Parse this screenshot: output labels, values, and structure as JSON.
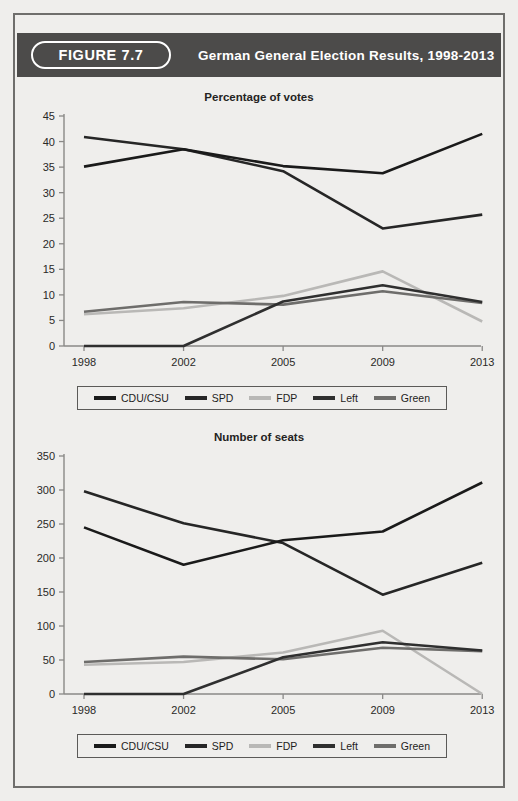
{
  "header": {
    "figure_badge": "FIGURE 7.7",
    "title": "German General Election Results, 1998-2013"
  },
  "colors": {
    "bar_background": "#4c4b4a",
    "page_background": "#efeeec",
    "frame": "#6f6e6c",
    "cdu_csu": "#1a1a1a",
    "spd": "#262626",
    "fdp": "#b9b8b6",
    "left": "#2f2f2f",
    "green": "#6e6d6b",
    "axis": "#8a8987",
    "text": "#242322"
  },
  "legend": {
    "entries": [
      {
        "label": "CDU/CSU",
        "color": "#1a1a1a"
      },
      {
        "label": "SPD",
        "color": "#262626"
      },
      {
        "label": "FDP",
        "color": "#b9b8b6"
      },
      {
        "label": "Left",
        "color": "#2f2f2f"
      },
      {
        "label": "Green",
        "color": "#6e6d6b"
      }
    ]
  },
  "chart_data": [
    {
      "id": "percentage-of-votes",
      "type": "line",
      "title": "Percentage of votes",
      "xlabel": "",
      "ylabel": "",
      "categories": [
        "1998",
        "2002",
        "2005",
        "2009",
        "2013"
      ],
      "x_ticks": [
        "1998",
        "2002",
        "2005",
        "2009",
        "2013"
      ],
      "y_ticks": [
        0,
        5,
        10,
        15,
        20,
        25,
        30,
        35,
        40,
        45
      ],
      "ylim": [
        0,
        45
      ],
      "grid": false,
      "legend_position": "bottom",
      "series": [
        {
          "name": "CDU/CSU",
          "color": "#1a1a1a",
          "values": [
            35.1,
            38.5,
            35.2,
            33.8,
            41.5
          ]
        },
        {
          "name": "SPD",
          "color": "#262626",
          "values": [
            40.9,
            38.5,
            34.2,
            23.0,
            25.7
          ]
        },
        {
          "name": "FDP",
          "color": "#b9b8b6",
          "values": [
            6.2,
            7.4,
            9.8,
            14.6,
            4.8
          ]
        },
        {
          "name": "Left",
          "color": "#2f2f2f",
          "values": [
            0.0,
            0.0,
            8.7,
            11.9,
            8.6
          ]
        },
        {
          "name": "Green",
          "color": "#6e6d6b",
          "values": [
            6.7,
            8.6,
            8.1,
            10.7,
            8.4
          ]
        }
      ]
    },
    {
      "id": "number-of-seats",
      "type": "line",
      "title": "Number of seats",
      "xlabel": "",
      "ylabel": "",
      "categories": [
        "1998",
        "2002",
        "2005",
        "2009",
        "2013"
      ],
      "x_ticks": [
        "1998",
        "2002",
        "2005",
        "2009",
        "2013"
      ],
      "y_ticks": [
        0,
        50,
        100,
        150,
        200,
        250,
        300,
        350
      ],
      "ylim": [
        0,
        350
      ],
      "grid": false,
      "legend_position": "bottom",
      "series": [
        {
          "name": "CDU/CSU",
          "color": "#1a1a1a",
          "values": [
            245,
            190,
            226,
            239,
            311
          ]
        },
        {
          "name": "SPD",
          "color": "#262626",
          "values": [
            298,
            251,
            222,
            146,
            193
          ]
        },
        {
          "name": "FDP",
          "color": "#b9b8b6",
          "values": [
            43,
            47,
            61,
            93,
            0
          ]
        },
        {
          "name": "Left",
          "color": "#2f2f2f",
          "values": [
            0,
            0,
            54,
            76,
            64
          ]
        },
        {
          "name": "Green",
          "color": "#6e6d6b",
          "values": [
            47,
            55,
            51,
            68,
            63
          ]
        }
      ]
    }
  ]
}
